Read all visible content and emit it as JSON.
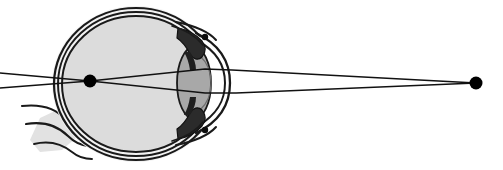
{
  "figure": {
    "width": 503,
    "height": 170,
    "background_color": "#ffffff"
  },
  "colors": {
    "background": "#ffffff",
    "outline": "#1a1a1a",
    "vitreous_fill": "#dcdcdc",
    "lens_fill": "#a8a8a8",
    "sclera_fill": "#f2f2f2",
    "optic_nerve_fill": "#e2e2e2",
    "ciliary_fill": "#2b2b2b",
    "ray_color": "#111111",
    "point_color": "#000000"
  },
  "eye": {
    "name": "human-eye-cross-section",
    "globe": {
      "center_x": 136,
      "center_y": 84,
      "radius_x": 82,
      "radius_y": 76
    },
    "layers": [
      {
        "name": "sclera",
        "offset": 0
      },
      {
        "name": "choroid",
        "offset": 4
      },
      {
        "name": "retina",
        "offset": 8
      }
    ],
    "lens": {
      "name": "crystalline-lens",
      "center_x": 194,
      "center_y": 83,
      "radius_x": 17,
      "radius_y": 36
    },
    "cornea": {
      "name": "cornea",
      "apex_x": 228,
      "top_y": 40,
      "bottom_y": 127
    },
    "ciliary_bodies": [
      {
        "name": "ciliary-body-superior",
        "x": 196,
        "y": 44
      },
      {
        "name": "ciliary-body-inferior",
        "x": 196,
        "y": 122
      }
    ],
    "schlemm_canals": [
      {
        "name": "canal-of-schlemm-superior",
        "x": 205,
        "y": 37,
        "r": 3.2
      },
      {
        "name": "canal-of-schlemm-inferior",
        "x": 205,
        "y": 130,
        "r": 3.2
      }
    ],
    "optic_nerve": {
      "name": "optic-nerve",
      "exit_x": 62,
      "exit_y": 126
    }
  },
  "optics": {
    "point_source": {
      "name": "distant-point-source",
      "x": 476,
      "y": 83,
      "radius": 6.5
    },
    "focal_point": {
      "name": "retinal-focal-point",
      "x": 90,
      "y": 81,
      "radius": 6.5
    },
    "rays": [
      {
        "name": "ray-upper",
        "points": [
          [
            476,
            83
          ],
          [
            232,
            70
          ],
          [
            205,
            69
          ],
          [
            90,
            81
          ],
          [
            0,
            88
          ]
        ]
      },
      {
        "name": "ray-lower",
        "points": [
          [
            476,
            83
          ],
          [
            236,
            93
          ],
          [
            205,
            93
          ],
          [
            90,
            81
          ],
          [
            0,
            73
          ]
        ]
      }
    ],
    "ray_count": 2
  }
}
